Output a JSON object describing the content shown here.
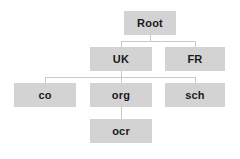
{
  "diagram": {
    "type": "hierarchy-tree",
    "node_fill_color": "#d3d3d3",
    "connector_color": "#c9c9c9",
    "text_color": "#1a1a1a",
    "background_color": "#ffffff",
    "nodes": [
      {
        "id": "root",
        "label": "Root",
        "level": 0,
        "x": 124,
        "y": 11,
        "w": 52,
        "h": 24
      },
      {
        "id": "uk",
        "label": "UK",
        "level": 1,
        "x": 90,
        "y": 47,
        "w": 62,
        "h": 24
      },
      {
        "id": "fr",
        "label": "FR",
        "level": 1,
        "x": 165,
        "y": 47,
        "w": 60,
        "h": 24
      },
      {
        "id": "co",
        "label": "co",
        "level": 2,
        "x": 14,
        "y": 83,
        "w": 62,
        "h": 24
      },
      {
        "id": "org",
        "label": "org",
        "level": 2,
        "x": 90,
        "y": 83,
        "w": 62,
        "h": 24
      },
      {
        "id": "sch",
        "label": "sch",
        "level": 2,
        "x": 165,
        "y": 83,
        "w": 60,
        "h": 24
      },
      {
        "id": "ocr",
        "label": "ocr",
        "level": 3,
        "x": 90,
        "y": 119,
        "w": 62,
        "h": 24
      }
    ],
    "edges": [
      {
        "from": "root",
        "to": "uk"
      },
      {
        "from": "root",
        "to": "fr"
      },
      {
        "from": "uk",
        "to": "co"
      },
      {
        "from": "uk",
        "to": "org"
      },
      {
        "from": "uk",
        "to": "sch"
      },
      {
        "from": "org",
        "to": "ocr"
      }
    ],
    "connector_segments": [
      {
        "id": "root-stem",
        "orient": "v",
        "x": 150,
        "y": 35,
        "len": 6
      },
      {
        "id": "root-bus",
        "orient": "h",
        "x": 121,
        "y": 41,
        "len": 74
      },
      {
        "id": "uk-drop",
        "orient": "v",
        "x": 121,
        "y": 41,
        "len": 6
      },
      {
        "id": "fr-drop",
        "orient": "v",
        "x": 195,
        "y": 41,
        "len": 6
      },
      {
        "id": "uk-stem",
        "orient": "v",
        "x": 121,
        "y": 71,
        "len": 6
      },
      {
        "id": "children-bus",
        "orient": "h",
        "x": 45,
        "y": 77,
        "len": 150
      },
      {
        "id": "co-drop",
        "orient": "v",
        "x": 45,
        "y": 77,
        "len": 6
      },
      {
        "id": "org-drop",
        "orient": "v",
        "x": 121,
        "y": 77,
        "len": 6
      },
      {
        "id": "sch-drop",
        "orient": "v",
        "x": 195,
        "y": 77,
        "len": 6
      },
      {
        "id": "ocr-stem",
        "orient": "v",
        "x": 121,
        "y": 107,
        "len": 12
      }
    ]
  }
}
